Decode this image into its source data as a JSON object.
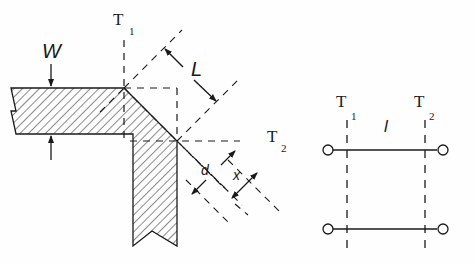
{
  "diagram": {
    "left_figure": {
      "labels": {
        "width": "W",
        "ref_plane_1": "T",
        "ref_plane_1_sub": "1",
        "ref_plane_2": "T",
        "ref_plane_2_sub": "2",
        "length": "L",
        "diag": "d",
        "miter": "x"
      }
    },
    "right_figure": {
      "labels": {
        "ref_plane_1": "T",
        "ref_plane_1_sub": "1",
        "ref_plane_2": "T",
        "ref_plane_2_sub": "2",
        "line_length": "l"
      }
    },
    "colors": {
      "stroke": "#1a1a1a",
      "background": "#fefefe"
    }
  }
}
